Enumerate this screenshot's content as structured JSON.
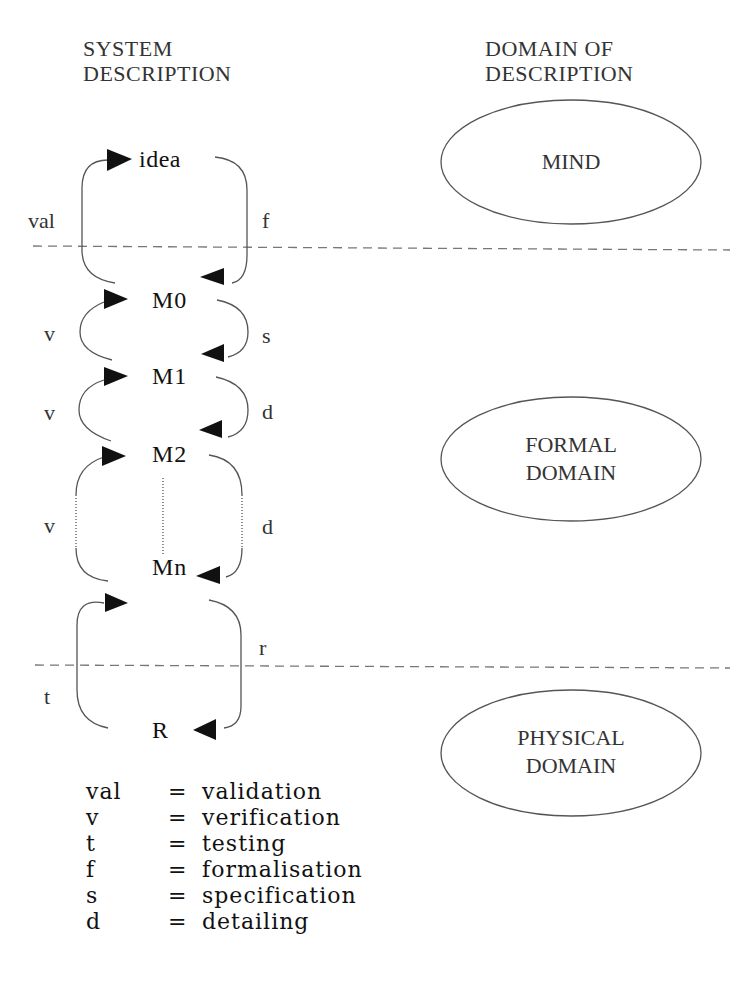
{
  "headers": {
    "left": [
      "SYSTEM",
      "DESCRIPTION"
    ],
    "right": [
      "DOMAIN OF",
      "DESCRIPTION"
    ]
  },
  "nodes": {
    "idea": "idea",
    "m0": "M0",
    "m1": "M1",
    "m2": "M2",
    "mn": "Mn",
    "r": "R"
  },
  "edge_labels": {
    "val": "val",
    "f": "f",
    "v1": "v",
    "s": "s",
    "v2": "v",
    "d1": "d",
    "v3": "v",
    "d2": "d",
    "r": "r",
    "t": "t"
  },
  "domains": {
    "mind": [
      "MIND"
    ],
    "formal": [
      "FORMAL",
      "DOMAIN"
    ],
    "physical": [
      "PHYSICAL",
      "DOMAIN"
    ]
  },
  "legend": [
    {
      "key": "val",
      "eq": "=",
      "meaning": "validation"
    },
    {
      "key": "v",
      "eq": "=",
      "meaning": "verification"
    },
    {
      "key": "t",
      "eq": "=",
      "meaning": "testing"
    },
    {
      "key": "f",
      "eq": "=",
      "meaning": "formalisation"
    },
    {
      "key": "s",
      "eq": "=",
      "meaning": "specification"
    },
    {
      "key": "d",
      "eq": "=",
      "meaning": "detailing"
    }
  ],
  "colors": {
    "line": "#555555",
    "arrow": "#111111",
    "background": "#ffffff"
  }
}
